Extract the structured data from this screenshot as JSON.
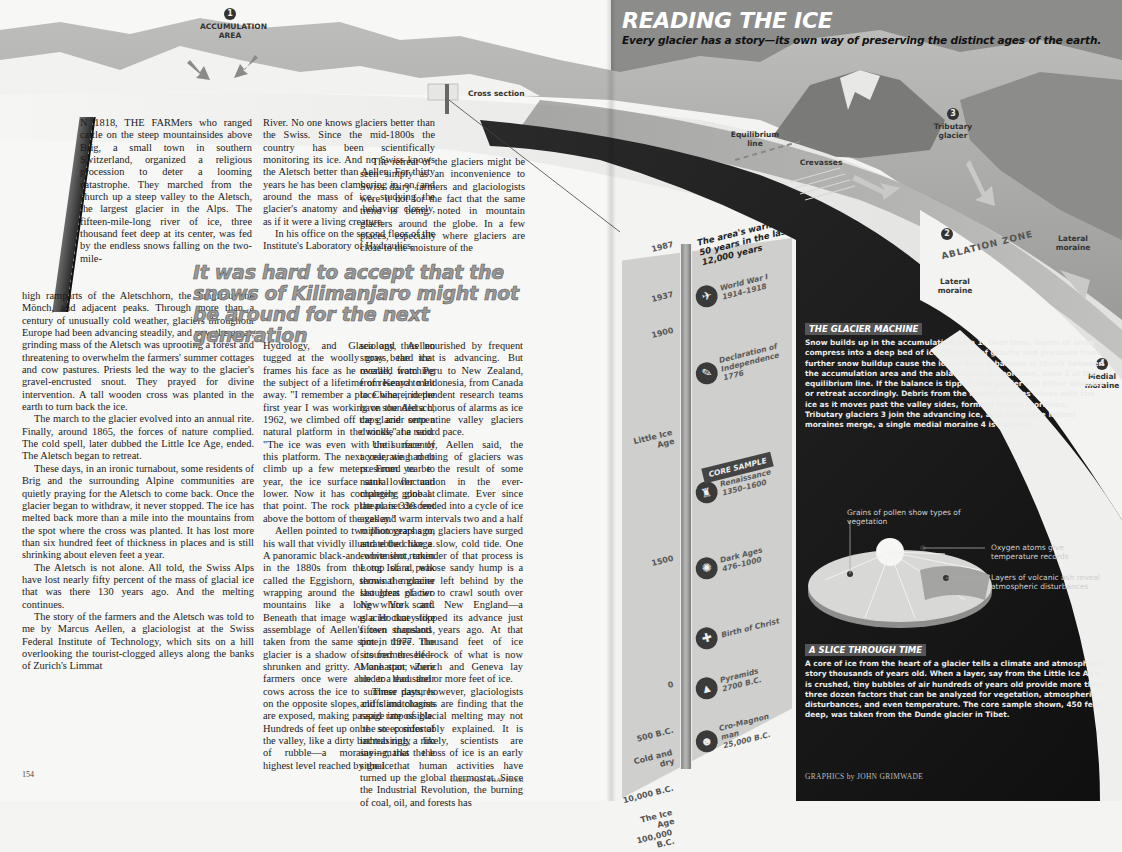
{
  "header": {
    "title": "READING THE ICE",
    "dek": "Every glacier has a story—its own way of preserving the distinct ages of the earth."
  },
  "diagram_labels": {
    "accumulation": {
      "number": "1",
      "text": "ACCUMULATION AREA"
    },
    "cross_section": "Cross section",
    "equilibrium_line": "Equilibrium line",
    "crevasses": "Crevasses",
    "tributary": {
      "number": "3",
      "text": "Tributary glacier"
    },
    "ablation": {
      "number": "2",
      "text": "ABLATION ZONE"
    },
    "lateral_moraine_left": "Lateral moraine",
    "lateral_moraine_right": "Lateral moraine",
    "medial": {
      "number": "4",
      "text": "Medial moraine"
    }
  },
  "article": {
    "col1_top": "N 1818, THE FARMers who ranged cattle on the steep mountainsides above Brig, a small town in southern Switzerland, organized a religious procession to deter a looming catastrophe. They marched from the church up a steep valley to the Aletsch, the largest glacier in the Alps. The fifteen-mile-long river of ice, three thousand feet deep at its center, was fed by the endless snows falling on the two-mile-",
    "col1_p1_cont": "high ramparts of the Aletschhorn, the Jungfrau, the Mönch, and adjacent peaks. Through more than a century of unusually cold weather, glaciers throughout Europe had been advancing steadily, and now the great, grinding mass of the Aletsch was uprooting a forest and threatening to overwhelm the farmers' summer cottages and cow pastures. Priests led the way to the glacier's gravel-encrusted snout. They prayed for divine intervention. A tall wooden cross was planted in the earth to turn back the ice.",
    "col1_p2": "The march to the glacier evolved into an annual rite. Finally, around 1865, the forces of nature complied. The cold spell, later dubbed the Little Ice Age, ended. The Aletsch began to retreat.",
    "col1_p3": "These days, in an ironic turnabout, some residents of Brig and the surrounding Alpine communities are quietly praying for the Aletsch to come back. Once the glacier began to withdraw, it never stopped. The ice has melted back more than a mile into the mountains from the spot where the cross was planted. It has lost more than six hundred feet of thickness in places and is still shrinking about eleven feet a year.",
    "col1_p4": "The Aletsch is not alone. All told, the Swiss Alps have lost nearly fifty percent of the mass of glacial ice that was there 130 years ago. And the melting continues.",
    "col1_p5": "The story of the farmers and the Aletsch was told to me by Marcus Aellen, a glaciologist at the Swiss Federal Institute of Technology, which sits on a hill overlooking the tourist-clogged alleys along the banks of Zurich's Limmat",
    "col2_p1": "River. No one knows glaciers better than the Swiss. Since the mid-1800s the country has been scientifically monitoring its ice. And no Swiss knows the Aletsch better than Aellen. For thirty years he has been clambering in, on, and around the mass of ice, studying the glacier's anatomy and behavior closely, as if it were a living creature.",
    "col2_p2": "In his office on the second floor of the Institute's Laboratory of Hydraulics,",
    "col2_p2_cont": "Hydrology, and Glaciology, Aellen tugged at the woolly gray beard that frames his face as he recalled watching the subject of a lifetime of research melt away. \"I remember a place where, in the first year I was working on the Aletsch, 1962, we climbed off the glacier onto a natural platform in the rocks,\" he said. \"The ice was even with the surface of this platform. The next year, we had to climb up a few meters. From year to year, the ice surface sank lower and lower. Now it has completely gone at that point. The rock plateau is 330 feet above the bottom of the valley.\"",
    "col2_p3": "Aellen pointed to two photographs on his wall that vividly illustrate the change. A panoramic black-and-white shot, taken in the 1880s from the top of a peak called the Eggishorn, shows the glacier wrapping around the shoulders of two mountains like a long white scarf. Beneath that image was a Hockney-like assemblage of Aellen's own snapshots, taken from the same spot in 1977. The glacier is a shadow of its former self—shrunken and gritty. At one spot where farmers once were able to lead their cows across the ice to summer pastures on the opposite slopes, cliffs and chasms are exposed, making passage impossible. Hundreds of feet up on the steep sides of the valley, like a dirty bathtub ring, a rim of rubble—a moraine—marks the highest level reached by the ice.",
    "col3_top": "The retreat of the glaciers might be seen simply as an inconvenience to Swiss dairy farmers and glaciologists were it not for the fact that the same trend is being noted in mountain glaciers around the globe. In a few places, especially where glaciers are close to the moisture of the",
    "col3_p1_cont": "sea and thus nourished by frequent snows, the ice is advancing. But overall, from Peru to New Zealand, from Kenya to Indonesia, from Canada to China, independent research teams have sounded a chorus of alarms as ice caps and serpentine valley glaciers dwindle at a record pace.",
    "col3_p2": "Until recently, Aellen said, the accelerating melting of glaciers was presumed to be the result of some natural fluctuation in the ever-changing global climate. Ever since the planet descended into a cycle of ice ages and warm intervals two and a half million years ago, glaciers have surged and ebbed like a slow, cold tide. One convenient reminder of that process is Long Island, whose sandy hump is a terminal moraine left behind by the last great glacier to crawl south over New York and New England—a glacier that stopped its advance just fifteen thousand years ago. At that time, three thousand feet of ice scoured the bedrock of what is now Manhattan; Zurich and Geneva lay under a thousand or more feet of ice.",
    "col3_p3": "These days, however, glaciologists and climatologists are finding that the rapid rate of glacial melting may not be so comfortably explained. It is increasingly likely, scientists are saying, that the loss of ice is an early signal that human activities have turned up the global thermostat. Since the Industrial Revolution, the burning of coal, oil, and forests has",
    "pull_quote": "It was hard to accept that the snows of Kilimanjaro might not be around for the next generation"
  },
  "folio": {
    "page_number": "154",
    "magazine": "Condé Nast TRAVELER"
  },
  "core_sample": {
    "tag": "CORE SAMPLE",
    "warm_note": "The area's warmest 50 years in the last 12,000 years",
    "years": [
      {
        "label": "1987",
        "top": 8
      },
      {
        "label": "1937",
        "top": 58
      },
      {
        "label": "1900",
        "top": 94
      },
      {
        "label": "Little Ice Age",
        "top": 196
      },
      {
        "label": "1500",
        "top": 322
      },
      {
        "label": "0",
        "top": 448
      },
      {
        "label": "500 B.C.",
        "top": 494
      },
      {
        "label": "Cold and dry",
        "top": 516
      },
      {
        "label": "10,000 B.C.",
        "top": 552
      },
      {
        "label": "The Ice Age",
        "top": 576
      },
      {
        "label": "100,000 B.C.",
        "top": 596
      }
    ],
    "events": [
      {
        "icon": "✈",
        "title": "World War I",
        "date": "1914–1918",
        "top": 50
      },
      {
        "icon": "✎",
        "title": "Declaration of Independence",
        "date": "1776",
        "top": 124
      },
      {
        "icon": "♜",
        "title": "Renaissance",
        "date": "1350–1600",
        "top": 246
      },
      {
        "icon": "✺",
        "title": "Dark Ages",
        "date": "476–1000",
        "top": 322
      },
      {
        "icon": "✚",
        "title": "Birth of Christ",
        "date": "",
        "top": 392
      },
      {
        "icon": "▲",
        "title": "Pyramids",
        "date": "2700 B.C.",
        "top": 442
      },
      {
        "icon": "☻",
        "title": "Cro-Magnon man",
        "date": "25,000 B.C.",
        "top": 492
      }
    ]
  },
  "glacier_machine": {
    "title": "THE GLACIER MACHINE",
    "text": "Snow builds up in the accumulation area 1. Over time, layers of snow compress into a deep bed of ice. The pull of gravity and pressure from further snow buildup cause the ice to flow. A balance is struck between the accumulation area and the ablation, or evaporation, zone 2 at the equilibrium line. If the balance is tipped, the glacier will either advance or retreat accordingly. Debris from the mountainsides mixes with the ice as it moves past the valley sides, forming lateral moraines. Tributary glaciers 3 join the advancing ice, and where the lateral moraines merge, a single medial moraine 4 is formed."
  },
  "slice_diagram": {
    "pollen": "Grains of pollen show types of vegetation",
    "oxygen": "Oxygen atoms give temperature records",
    "ash": "Layers of volcanic ash reveal atmospheric disturbances"
  },
  "slice_through_time": {
    "title": "A SLICE THROUGH TIME",
    "text": "A core of ice from the heart of a glacier tells a climate and atmosphere story thousands of years old. When a layer, say from the Little Ice Age, is crushed, tiny bubbles of air hundreds of years old provide more than three dozen factors that can be analyzed for vegetation, atmospheric disturbances, and even temperature. The core sample shown, 450 feet deep, was taken from the Dunde glacier in Tibet."
  },
  "credit": "GRAPHICS by JOHN GRIMWADE",
  "colors": {
    "ice_dark": "#1c1c1c",
    "ice_light": "#e9e9e7",
    "rock": "#8e8e8c",
    "pull_quote": "#9a9a9a"
  }
}
